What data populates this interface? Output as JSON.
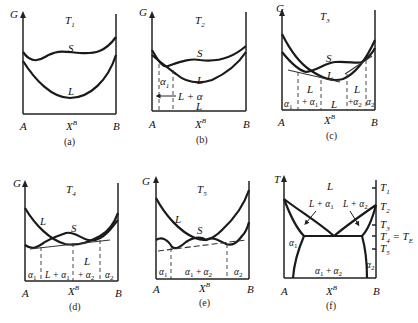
{
  "figure": {
    "panels": [
      {
        "id": "a",
        "caption": "(a)",
        "y_axis": "G",
        "temperature": "T1",
        "temp_label": "T",
        "temp_sub": "1",
        "x_axis": "X",
        "x_axis_sup": "B",
        "left_end": "A",
        "right_end": "B",
        "curves": [
          "S",
          "L"
        ],
        "regions": []
      },
      {
        "id": "b",
        "caption": "(b)",
        "y_axis": "G",
        "temperature": "T2",
        "temp_label": "T",
        "temp_sub": "2",
        "x_axis": "X",
        "x_axis_sup": "B",
        "left_end": "A",
        "right_end": "B",
        "curves": [
          "S",
          "L"
        ],
        "regions": [
          "α1",
          "L + α",
          "L"
        ]
      },
      {
        "id": "c",
        "caption": "(c)",
        "y_axis": "G",
        "temperature": "T3",
        "temp_label": "T",
        "temp_sub": "3",
        "x_axis": "X",
        "x_axis_sup": "B",
        "left_end": "A",
        "right_end": "B",
        "curves": [
          "S",
          "L"
        ],
        "regions": [
          "α1",
          "L + α1",
          "L",
          "L + α2",
          "α2"
        ]
      },
      {
        "id": "d",
        "caption": "(d)",
        "y_axis": "G",
        "temperature": "T4",
        "temp_label": "T",
        "temp_sub": "4",
        "x_axis": "X",
        "x_axis_sup": "B",
        "left_end": "A",
        "right_end": "B",
        "curves": [
          "L",
          "S"
        ],
        "regions": [
          "α1",
          "L + α1",
          "L + α2",
          "α2"
        ]
      },
      {
        "id": "e",
        "caption": "(e)",
        "y_axis": "G",
        "temperature": "T5",
        "temp_label": "T",
        "temp_sub": "5",
        "x_axis": "X",
        "x_axis_sup": "B",
        "left_end": "A",
        "right_end": "B",
        "curves": [
          "L",
          "S"
        ],
        "regions": [
          "α1",
          "α1 + α2",
          "α2"
        ]
      },
      {
        "id": "f",
        "caption": "(f)",
        "y_axis": "T",
        "x_axis": "X",
        "x_axis_sup": "B",
        "left_end": "A",
        "right_end": "B",
        "regions": [
          "L",
          "L + α1",
          "L + α2",
          "α1",
          "α2",
          "α1 + α2"
        ],
        "temperature_ticks": [
          "T1",
          "T2",
          "T3",
          "T4 = TE",
          "T5"
        ]
      }
    ],
    "labels": {
      "G": "G",
      "T": "T",
      "S": "S",
      "L": "L",
      "A": "A",
      "B": "B",
      "X": "X",
      "sup_B": "B",
      "alpha": "α",
      "sub1": "1",
      "sub2": "2",
      "sub3": "3",
      "sub4": "4",
      "sub5": "5",
      "subE": "E",
      "plus": "+",
      "L_plus": "L +",
      "plus_only": "+",
      "L_plus_alpha": "L + α",
      "eq": "=",
      "cap_a": "(a)",
      "cap_b": "(b)",
      "cap_c": "(c)",
      "cap_d": "(d)",
      "cap_e": "(e)",
      "cap_f": "(f)"
    }
  }
}
